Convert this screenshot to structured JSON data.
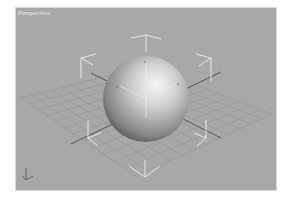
{
  "viewport": {
    "label": "Perspective",
    "background": "#a8a8a8",
    "object": "sphere",
    "grid": "home-grid",
    "selection": "bounding-brackets",
    "gizmo": "transform-gizmo",
    "axis_icon": "world-axis-tripod"
  },
  "colors": {
    "grid_line": "#939393",
    "grid_axis": "#4a4a4a",
    "bracket": "#f2f2f2",
    "sphere_light": "#f4f4f4",
    "sphere_dark": "#3c3c3c"
  }
}
